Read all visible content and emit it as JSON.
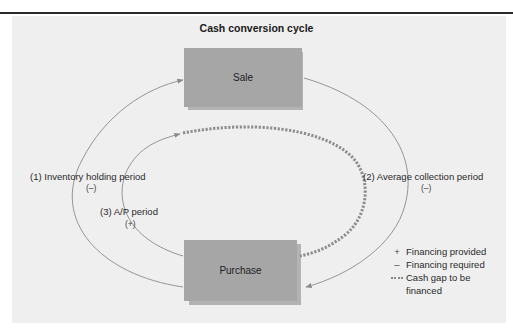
{
  "title": "Cash conversion cycle",
  "nodes": {
    "sale": {
      "label": "Sale"
    },
    "purchase": {
      "label": "Purchase"
    }
  },
  "periods": {
    "inventory": {
      "label": "(1) Inventory holding period",
      "sign": "(–)"
    },
    "collection": {
      "label": "(2) Average collection period",
      "sign": "(–)"
    },
    "ap": {
      "label": "(3) A/P period",
      "sign": "(+)"
    }
  },
  "legend": {
    "items": [
      {
        "symbol": "+",
        "label": "Financing provided"
      },
      {
        "symbol": "–",
        "label": "Financing required"
      },
      {
        "symbol": "dashed",
        "label": "Cash gap to be",
        "label2": "financed"
      }
    ]
  },
  "colors": {
    "panel": "#efefef",
    "box": "#a6a6a6",
    "box_shadow": "#b3b3b3",
    "arc": "#8a8a8a",
    "gap": "#8c8c8c"
  }
}
